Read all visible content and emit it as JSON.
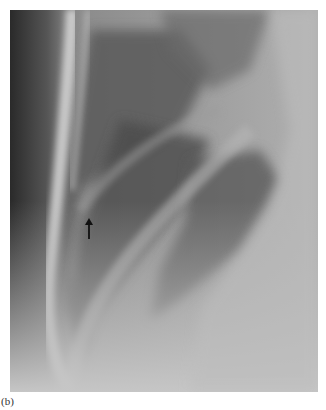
{
  "figure": {
    "panel_label": "(b)",
    "image_description": "Lateral chest radiograph showing lung region with rib shadows and an arrow marker",
    "annotation": {
      "type": "arrow",
      "direction": "up",
      "color": "#111111"
    },
    "colors": {
      "background": "#ffffff",
      "film_mid": "#a9a9a9",
      "film_dark": "#4a4a4a",
      "film_light": "#d0d0d0"
    }
  }
}
